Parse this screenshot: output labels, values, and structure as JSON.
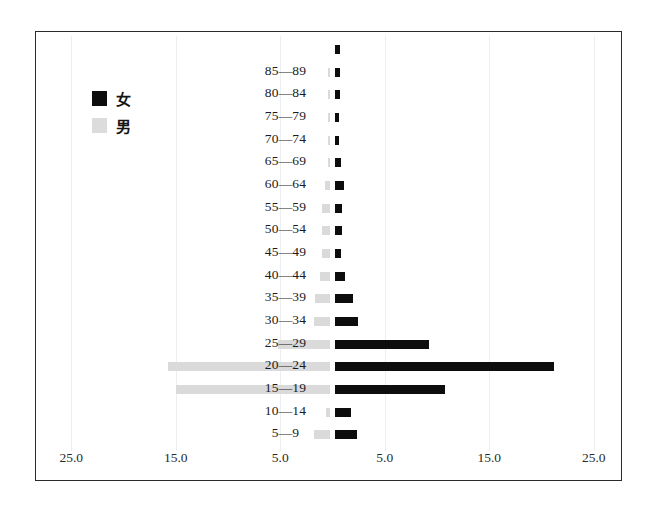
{
  "chart_data": {
    "type": "bar",
    "title": "",
    "subtitle": "",
    "orientation": "horizontal",
    "style": "population-pyramid",
    "xlabel": "",
    "ylabel": "",
    "xlim": [
      -30,
      30
    ],
    "xticks": [
      25.0,
      15.0,
      5.0,
      5.0,
      15.0,
      25.0
    ],
    "xtick_labels": [
      "25.0",
      "15.0",
      "5.0",
      "5.0",
      "15.0",
      "25.0"
    ],
    "grid": true,
    "legend_position": "upper-left",
    "categories": [
      "5—9",
      "10—14",
      "15—19",
      "20—24",
      "25—29",
      "30—34",
      "35—39",
      "40—44",
      "45—49",
      "50—54",
      "55—59",
      "60—64",
      "65—69",
      "70—74",
      "75—79",
      "80—84",
      "85—89",
      ""
    ],
    "series": [
      {
        "name": "女",
        "side": "right",
        "color": "#0d0d0d",
        "values": [
          2.1,
          1.5,
          10.5,
          21.0,
          9.0,
          2.2,
          1.7,
          1.0,
          0.6,
          0.7,
          0.7,
          0.9,
          0.6,
          0.4,
          0.4,
          0.5,
          0.5,
          0.5
        ]
      },
      {
        "name": "男",
        "side": "left",
        "color": "#dadada",
        "values": [
          1.5,
          0.4,
          14.7,
          15.5,
          5.0,
          1.5,
          1.4,
          1.0,
          0.8,
          0.8,
          0.8,
          0.5,
          0.2,
          0.2,
          0.2,
          0.2,
          0.2,
          0.0
        ]
      }
    ]
  },
  "legend": {
    "female_label": "女",
    "male_label": "男"
  },
  "axis": {
    "tick_0": "25.0",
    "tick_1": "15.0",
    "tick_2": "5.0",
    "tick_3": "5.0",
    "tick_4": "15.0",
    "tick_5": "25.0"
  }
}
